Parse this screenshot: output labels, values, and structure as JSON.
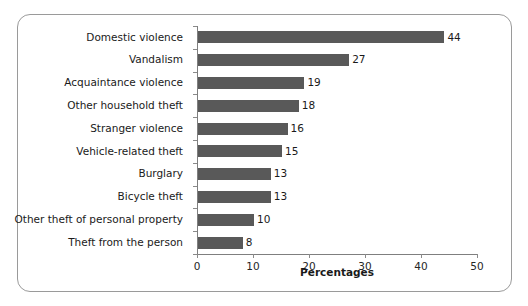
{
  "figure": {
    "frame_border_color": "#9a9a9a",
    "background_color": "#ffffff"
  },
  "chart_data": {
    "type": "bar",
    "orientation": "horizontal",
    "title": "",
    "subtitle": "",
    "xlabel": "Percentages",
    "ylabel": "",
    "xlim": [
      0,
      50
    ],
    "xticks": [
      0,
      10,
      20,
      30,
      40,
      50
    ],
    "xticklabels": [
      "0",
      "10",
      "20",
      "30",
      "40",
      "50"
    ],
    "grid": false,
    "legend": null,
    "bar_color": "#595959",
    "categories": [
      "Domestic violence",
      "Vandalism",
      "Acquaintance violence",
      "Other household theft",
      "Stranger violence",
      "Vehicle-related theft",
      "Burglary",
      "Bicycle theft",
      "Other theft of personal property",
      "Theft from the person"
    ],
    "values": [
      44,
      27,
      19,
      18,
      16,
      15,
      13,
      13,
      10,
      8
    ],
    "data_labels": [
      "44",
      "27",
      "19",
      "18",
      "16",
      "15",
      "13",
      "13",
      "10",
      "8"
    ]
  }
}
